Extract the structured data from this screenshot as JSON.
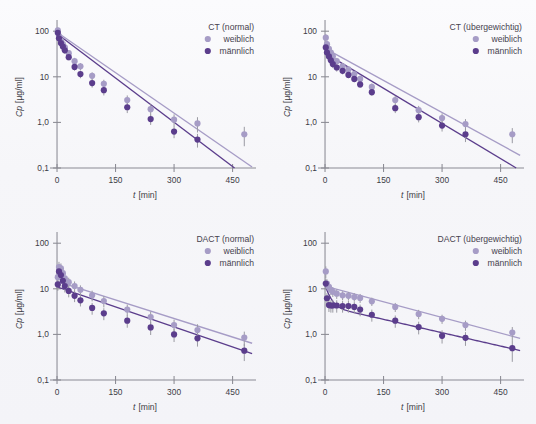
{
  "figure": {
    "background_color": "#f6f6f9",
    "panel_count": 4,
    "series_colors": {
      "weiblich": "#a69cc6",
      "maennlich": "#5b3d8c",
      "axis": "#8a8a93",
      "errorbar": "#9a9aa2",
      "text": "#3d3d46"
    }
  },
  "axes_common": {
    "xlabel_italic": "t",
    "xlabel_unit": "[min]",
    "ylabel_italic": "Cp",
    "ylabel_unit": "[µg/ml]",
    "x_ticks": [
      "0",
      "150",
      "300",
      "450"
    ],
    "x_tick_values": [
      0,
      150,
      300,
      450
    ],
    "y_ticks": [
      "0,1",
      "1,0",
      "10",
      "100"
    ],
    "y_tick_values": [
      0.1,
      1,
      10,
      100
    ],
    "xlim": [
      -18,
      510
    ],
    "ylim": [
      0.1,
      130
    ],
    "yscale": "log",
    "grid": false,
    "legend_position": "top-right"
  },
  "legend_entries": [
    {
      "key": "weiblich",
      "label": "weiblich",
      "color": "#a69cc6"
    },
    {
      "key": "maennlich",
      "label": "männlich",
      "color": "#5b3d8c"
    }
  ],
  "chart_data": [
    {
      "id": "ct-normal",
      "type": "scatter",
      "title": "CT (normal)",
      "xlabel": "t [min]",
      "ylabel": "Cp [µg/ml]",
      "xlim": [
        -18,
        510
      ],
      "ylim": [
        0.1,
        130
      ],
      "yscale": "log",
      "grid": false,
      "legend": [
        "weiblich",
        "männlich"
      ],
      "series": [
        {
          "name": "weiblich",
          "color": "#a69cc6",
          "x": [
            2,
            5,
            10,
            15,
            20,
            30,
            45,
            60,
            90,
            120,
            180,
            240,
            300,
            360,
            480
          ],
          "y": [
            105,
            78,
            62,
            52,
            44,
            33,
            22,
            17,
            10.5,
            7.0,
            3.1,
            1.95,
            1.15,
            0.95,
            0.55
          ],
          "yerr_lo": [
            16,
            12,
            10,
            9,
            7,
            5,
            4,
            3,
            2.0,
            1.6,
            0.8,
            0.55,
            0.35,
            0.35,
            0.25
          ],
          "yerr_hi": [
            16,
            12,
            10,
            9,
            7,
            5,
            4,
            3,
            2.0,
            1.6,
            0.8,
            0.55,
            0.35,
            0.35,
            0.25
          ],
          "fit": {
            "type": "loglinear",
            "x0": 0,
            "y0": 95,
            "x1": 500,
            "y1": 0.105
          }
        },
        {
          "name": "männlich",
          "color": "#5b3d8c",
          "x": [
            2,
            5,
            10,
            15,
            20,
            30,
            45,
            60,
            90,
            120,
            180,
            240,
            300,
            360
          ],
          "y": [
            92,
            70,
            55,
            46,
            38,
            27,
            16.5,
            11.5,
            7.3,
            5.1,
            2.15,
            1.18,
            0.63,
            0.42
          ],
          "yerr_lo": [
            14,
            11,
            9,
            8,
            6,
            4,
            3,
            2.2,
            1.5,
            1.2,
            0.55,
            0.3,
            0.18,
            0.14
          ],
          "yerr_hi": [
            14,
            11,
            9,
            8,
            6,
            4,
            3,
            2.2,
            1.5,
            1.2,
            0.55,
            0.3,
            0.18,
            0.14
          ],
          "fit": {
            "type": "loglinear",
            "x0": 0,
            "y0": 88,
            "x1": 455,
            "y1": 0.1
          }
        }
      ]
    },
    {
      "id": "ct-uebergewichtig",
      "type": "scatter",
      "title": "CT (übergewichtig)",
      "xlabel": "t [min]",
      "ylabel": "Cp [µg/ml]",
      "xlim": [
        -18,
        510
      ],
      "ylim": [
        0.1,
        130
      ],
      "yscale": "log",
      "grid": false,
      "legend": [
        "weiblich",
        "männlich"
      ],
      "series": [
        {
          "name": "weiblich",
          "color": "#a69cc6",
          "x": [
            2,
            5,
            10,
            15,
            20,
            30,
            45,
            60,
            75,
            90,
            120,
            180,
            240,
            300,
            360,
            480
          ],
          "y": [
            72,
            52,
            41,
            34,
            28,
            22,
            17,
            14.5,
            11.5,
            9.0,
            6.0,
            3.1,
            1.85,
            1.25,
            0.92,
            0.55
          ],
          "yerr_lo": [
            14,
            10,
            8,
            7,
            5,
            4,
            3,
            2.5,
            2.0,
            1.6,
            1.1,
            0.7,
            0.45,
            0.32,
            0.26,
            0.2
          ],
          "yerr_hi": [
            14,
            10,
            8,
            7,
            5,
            4,
            3,
            2.5,
            2.0,
            1.6,
            1.1,
            0.7,
            0.45,
            0.32,
            0.26,
            0.2
          ],
          "fit": {
            "type": "loglinear",
            "x0": 0,
            "y0": 42,
            "x1": 500,
            "y1": 0.19
          }
        },
        {
          "name": "männlich",
          "color": "#5b3d8c",
          "x": [
            2,
            5,
            10,
            15,
            20,
            30,
            45,
            60,
            75,
            90,
            120,
            180,
            240,
            300,
            360
          ],
          "y": [
            44,
            34,
            28,
            23,
            19,
            16,
            13.5,
            11.0,
            9.0,
            6.8,
            4.6,
            2.05,
            1.3,
            0.85,
            0.55
          ],
          "yerr_lo": [
            9,
            7,
            5,
            4.5,
            3.5,
            3,
            2.2,
            1.8,
            1.5,
            1.1,
            0.8,
            0.45,
            0.3,
            0.22,
            0.18
          ],
          "yerr_hi": [
            9,
            7,
            5,
            4.5,
            3.5,
            3,
            2.2,
            1.8,
            1.5,
            1.1,
            0.8,
            0.45,
            0.3,
            0.22,
            0.18
          ],
          "fit": {
            "type": "loglinear",
            "x0": 0,
            "y0": 33,
            "x1": 490,
            "y1": 0.1
          }
        }
      ]
    },
    {
      "id": "dact-normal",
      "type": "scatter",
      "title": "DACT (normal)",
      "xlabel": "t [min]",
      "ylabel": "Cp [µg/ml]",
      "xlim": [
        -18,
        510
      ],
      "ylim": [
        0.1,
        130
      ],
      "yscale": "log",
      "grid": false,
      "legend": [
        "weiblich",
        "männlich"
      ],
      "series": [
        {
          "name": "weiblich",
          "color": "#a69cc6",
          "x": [
            2,
            5,
            10,
            15,
            20,
            30,
            45,
            60,
            90,
            120,
            180,
            240,
            300,
            360,
            480
          ],
          "y": [
            18,
            30,
            28,
            22,
            17,
            14,
            11.5,
            9.5,
            7.2,
            5.4,
            3.5,
            2.4,
            1.6,
            1.25,
            0.85
          ],
          "yerr_lo": [
            5,
            9,
            8,
            6,
            4.5,
            3.5,
            3,
            2.4,
            1.9,
            1.5,
            1.0,
            0.75,
            0.5,
            0.42,
            0.3
          ],
          "yerr_hi": [
            5,
            9,
            8,
            6,
            4.5,
            3.5,
            3,
            2.4,
            1.9,
            1.5,
            1.0,
            0.75,
            0.5,
            0.42,
            0.3
          ],
          "fit": {
            "type": "loglinear",
            "x0": 0,
            "y0": 14.5,
            "x1": 500,
            "y1": 0.64
          }
        },
        {
          "name": "männlich",
          "color": "#5b3d8c",
          "x": [
            2,
            5,
            10,
            15,
            20,
            30,
            45,
            60,
            90,
            120,
            180,
            240,
            300,
            360,
            480
          ],
          "y": [
            12.5,
            24,
            20,
            15,
            11.5,
            9.0,
            7.0,
            5.6,
            3.8,
            2.9,
            2.0,
            1.42,
            1.0,
            0.82,
            0.44
          ],
          "yerr_lo": [
            3.5,
            7,
            6,
            4.5,
            3.2,
            2.5,
            1.9,
            1.5,
            1.1,
            0.85,
            0.6,
            0.45,
            0.32,
            0.28,
            0.18
          ],
          "yerr_hi": [
            3.5,
            7,
            6,
            4.5,
            3.2,
            2.5,
            1.9,
            1.5,
            1.1,
            0.85,
            0.6,
            0.45,
            0.32,
            0.28,
            0.18
          ],
          "fit": {
            "type": "loglinear",
            "x0": 0,
            "y0": 11.0,
            "x1": 500,
            "y1": 0.38
          }
        }
      ]
    },
    {
      "id": "dact-uebergewichtig",
      "type": "scatter",
      "title": "DACT (übergewichtig)",
      "xlabel": "t [min]",
      "ylabel": "Cp [µg/ml]",
      "xlim": [
        -18,
        510
      ],
      "ylim": [
        0.1,
        130
      ],
      "yscale": "log",
      "grid": false,
      "legend": [
        "weiblich",
        "männlich"
      ],
      "series": [
        {
          "name": "weiblich",
          "color": "#a69cc6",
          "x": [
            2,
            5,
            10,
            15,
            20,
            30,
            45,
            60,
            75,
            90,
            120,
            180,
            240,
            300,
            360,
            480
          ],
          "y": [
            24,
            13.0,
            11.0,
            9.5,
            8.6,
            7.8,
            7.2,
            7.0,
            6.6,
            6.3,
            5.3,
            4.0,
            2.8,
            2.2,
            1.6,
            1.1
          ],
          "yerr_lo": [
            7,
            3.2,
            2.6,
            2.2,
            2.0,
            1.8,
            1.6,
            1.5,
            1.4,
            1.4,
            1.1,
            0.9,
            0.65,
            0.5,
            0.4,
            0.35
          ],
          "yerr_hi": [
            7,
            3.2,
            2.6,
            2.2,
            2.0,
            1.8,
            1.6,
            1.5,
            1.4,
            1.4,
            1.1,
            0.9,
            0.65,
            0.5,
            0.4,
            0.35
          ],
          "fit": {
            "type": "loglinear",
            "x0": 0,
            "y0": 11.5,
            "x1": 500,
            "y1": 0.82
          }
        },
        {
          "name": "männlich",
          "color": "#5b3d8c",
          "x": [
            2,
            5,
            10,
            15,
            20,
            30,
            45,
            60,
            75,
            90,
            120,
            180,
            240,
            300,
            360,
            480
          ],
          "y": [
            13.0,
            6.2,
            4.4,
            4.3,
            4.3,
            4.3,
            4.2,
            4.2,
            4.0,
            3.5,
            2.7,
            2.0,
            1.45,
            0.93,
            0.84,
            0.5
          ],
          "yerr_lo": [
            3.5,
            1.8,
            1.3,
            1.3,
            1.3,
            1.3,
            1.2,
            1.2,
            1.1,
            1.0,
            0.8,
            0.6,
            0.45,
            0.3,
            0.28,
            0.25
          ],
          "yerr_hi": [
            3.5,
            1.8,
            1.3,
            1.3,
            1.3,
            1.3,
            1.2,
            1.2,
            1.1,
            1.0,
            0.8,
            0.6,
            0.45,
            0.3,
            0.28,
            0.25
          ],
          "fit": {
            "type": "biexp",
            "y0": 12.0,
            "a": 8.0,
            "k1": 0.085,
            "b": 4.2,
            "k2": 0.0045
          }
        }
      ]
    }
  ]
}
